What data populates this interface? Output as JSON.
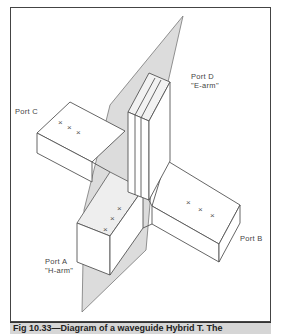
{
  "figure": {
    "caption": "Fig 10.33—Diagram of a waveguide Hybrid T. The",
    "colors": {
      "line": "#555555",
      "plane": "#d9d9d9",
      "frame": "#444444",
      "caption_bg": "#d6d6d6"
    }
  },
  "ports": {
    "a": {
      "name": "Port A",
      "alias": "\"H-arm\""
    },
    "b": {
      "name": "Port B"
    },
    "c": {
      "name": "Port C"
    },
    "d": {
      "name": "Port D",
      "alias": "\"E-arm\""
    }
  },
  "markers": {
    "symbol": "x x x"
  }
}
